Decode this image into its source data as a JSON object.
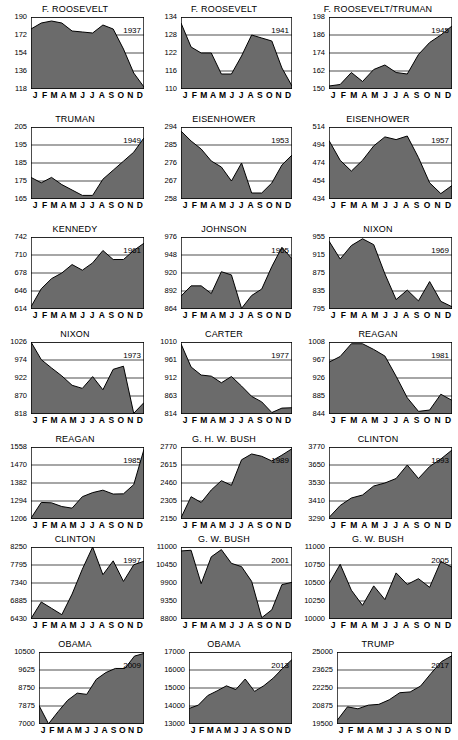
{
  "figure": {
    "type": "small-multiples-area-charts",
    "panel_count": 21,
    "x_tick_labels": [
      "J",
      "F",
      "M",
      "A",
      "M",
      "J",
      "J",
      "A",
      "S",
      "O",
      "N",
      "D"
    ],
    "area_fill_color": "#6b6b6b",
    "line_color": "#000000",
    "grid_color": "#000000",
    "background_color": "#ffffff"
  },
  "chart_data": [
    {
      "type": "area",
      "title": "F. ROOSEVELT",
      "annotation": "1937",
      "xlabel": "",
      "ylabel": "",
      "ylim": [
        118,
        190
      ],
      "yticks": [
        118,
        136,
        154,
        172,
        190
      ],
      "categories": [
        "J",
        "F",
        "M",
        "A",
        "M",
        "J",
        "J",
        "A",
        "S",
        "O",
        "N",
        "D"
      ],
      "values": [
        178,
        184,
        186,
        184,
        176,
        175,
        174,
        182,
        178,
        158,
        134,
        120
      ]
    },
    {
      "type": "area",
      "title": "F. ROOSEVELT",
      "annotation": "1941",
      "xlabel": "",
      "ylabel": "",
      "ylim": [
        110,
        134
      ],
      "yticks": [
        110,
        116,
        122,
        128,
        134
      ],
      "categories": [
        "J",
        "F",
        "M",
        "A",
        "M",
        "J",
        "J",
        "A",
        "S",
        "O",
        "N",
        "D"
      ],
      "values": [
        132,
        124,
        122,
        122,
        115,
        115,
        121,
        128,
        127,
        126,
        117,
        111
      ]
    },
    {
      "type": "area",
      "title": "F. ROOSEVELT/TRUMAN",
      "annotation": "1945",
      "xlabel": "",
      "ylabel": "",
      "ylim": [
        150,
        198
      ],
      "yticks": [
        150,
        162,
        174,
        186,
        198
      ],
      "categories": [
        "J",
        "F",
        "M",
        "A",
        "M",
        "J",
        "J",
        "A",
        "S",
        "O",
        "N",
        "D"
      ],
      "values": [
        152,
        153,
        161,
        155,
        163,
        166,
        161,
        160,
        173,
        181,
        186,
        192
      ]
    },
    {
      "type": "area",
      "title": "TRUMAN",
      "annotation": "1949",
      "xlabel": "",
      "ylabel": "",
      "ylim": [
        165,
        205
      ],
      "yticks": [
        165,
        175,
        185,
        195,
        205
      ],
      "categories": [
        "J",
        "F",
        "M",
        "A",
        "M",
        "J",
        "J",
        "A",
        "S",
        "O",
        "N",
        "D"
      ],
      "values": [
        177,
        174,
        177,
        173,
        170,
        167,
        167,
        176,
        181,
        186,
        191,
        199
      ]
    },
    {
      "type": "area",
      "title": "EISENHOWER",
      "annotation": "1953",
      "xlabel": "",
      "ylabel": "",
      "ylim": [
        258,
        294
      ],
      "yticks": [
        258,
        267,
        276,
        285,
        294
      ],
      "categories": [
        "J",
        "F",
        "M",
        "A",
        "M",
        "J",
        "J",
        "A",
        "S",
        "O",
        "N",
        "D"
      ],
      "values": [
        292,
        287,
        283,
        277,
        274,
        267,
        276,
        261,
        261,
        266,
        275,
        280
      ]
    },
    {
      "type": "area",
      "title": "EISENHOWER",
      "annotation": "1957",
      "xlabel": "",
      "ylabel": "",
      "ylim": [
        434,
        514
      ],
      "yticks": [
        434,
        454,
        474,
        494,
        514
      ],
      "categories": [
        "J",
        "F",
        "M",
        "A",
        "M",
        "J",
        "J",
        "A",
        "S",
        "O",
        "N",
        "D"
      ],
      "values": [
        499,
        477,
        465,
        477,
        493,
        503,
        500,
        504,
        480,
        452,
        440,
        449
      ]
    },
    {
      "type": "area",
      "title": "KENNEDY",
      "annotation": "1961",
      "xlabel": "",
      "ylabel": "",
      "ylim": [
        614,
        742
      ],
      "yticks": [
        614,
        646,
        678,
        710,
        742
      ],
      "categories": [
        "J",
        "F",
        "M",
        "A",
        "M",
        "J",
        "J",
        "A",
        "S",
        "O",
        "N",
        "D"
      ],
      "values": [
        618,
        650,
        668,
        678,
        693,
        683,
        696,
        718,
        702,
        702,
        718,
        731
      ]
    },
    {
      "type": "area",
      "title": "JOHNSON",
      "annotation": "1965",
      "xlabel": "",
      "ylabel": "",
      "ylim": [
        864,
        976
      ],
      "yticks": [
        864,
        892,
        920,
        948,
        976
      ],
      "categories": [
        "J",
        "F",
        "M",
        "A",
        "M",
        "J",
        "J",
        "A",
        "S",
        "O",
        "N",
        "D"
      ],
      "values": [
        884,
        900,
        900,
        888,
        922,
        917,
        865,
        885,
        895,
        930,
        960,
        942
      ]
    },
    {
      "type": "area",
      "title": "NIXON",
      "annotation": "1969",
      "xlabel": "",
      "ylabel": "",
      "ylim": [
        795,
        955
      ],
      "yticks": [
        795,
        835,
        875,
        915,
        955
      ],
      "categories": [
        "J",
        "F",
        "M",
        "A",
        "M",
        "J",
        "J",
        "A",
        "S",
        "O",
        "N",
        "D"
      ],
      "values": [
        946,
        906,
        936,
        951,
        938,
        873,
        816,
        837,
        813,
        856,
        812,
        800
      ]
    },
    {
      "type": "area",
      "title": "NIXON",
      "annotation": "1973",
      "xlabel": "",
      "ylabel": "",
      "ylim": [
        818,
        1026
      ],
      "yticks": [
        818,
        870,
        922,
        974,
        1026
      ],
      "categories": [
        "J",
        "F",
        "M",
        "A",
        "M",
        "J",
        "J",
        "A",
        "S",
        "O",
        "N",
        "D"
      ],
      "values": [
        1026,
        975,
        951,
        928,
        901,
        892,
        926,
        888,
        947,
        956,
        820,
        851
      ]
    },
    {
      "type": "area",
      "title": "CARTER",
      "annotation": "1977",
      "xlabel": "",
      "ylabel": "",
      "ylim": [
        814,
        1010
      ],
      "yticks": [
        814,
        863,
        912,
        961,
        1010
      ],
      "categories": [
        "J",
        "F",
        "M",
        "A",
        "M",
        "J",
        "J",
        "A",
        "S",
        "O",
        "N",
        "D"
      ],
      "values": [
        1005,
        942,
        920,
        917,
        899,
        916,
        890,
        862,
        847,
        818,
        830,
        831
      ]
    },
    {
      "type": "area",
      "title": "REAGAN",
      "annotation": "1981",
      "xlabel": "",
      "ylabel": "",
      "ylim": [
        844,
        1008
      ],
      "yticks": [
        844,
        885,
        926,
        967,
        1008
      ],
      "categories": [
        "J",
        "F",
        "M",
        "A",
        "M",
        "J",
        "J",
        "A",
        "S",
        "O",
        "N",
        "D"
      ],
      "values": [
        962,
        975,
        1004,
        1004,
        991,
        976,
        930,
        881,
        850,
        853,
        889,
        875
      ]
    },
    {
      "type": "area",
      "title": "REAGAN",
      "annotation": "1985",
      "xlabel": "",
      "ylabel": "",
      "ylim": [
        1206,
        1558
      ],
      "yticks": [
        1206,
        1294,
        1382,
        1470,
        1558
      ],
      "categories": [
        "J",
        "F",
        "M",
        "A",
        "M",
        "J",
        "J",
        "A",
        "S",
        "O",
        "N",
        "D"
      ],
      "values": [
        1210,
        1287,
        1285,
        1267,
        1259,
        1315,
        1335,
        1347,
        1328,
        1329,
        1374,
        1547
      ]
    },
    {
      "type": "area",
      "title": "G. H. W. BUSH",
      "annotation": "1989",
      "xlabel": "",
      "ylabel": "",
      "ylim": [
        2150,
        2770
      ],
      "yticks": [
        2150,
        2305,
        2460,
        2615,
        2770
      ],
      "categories": [
        "J",
        "F",
        "M",
        "A",
        "M",
        "J",
        "J",
        "A",
        "S",
        "O",
        "N",
        "D"
      ],
      "values": [
        2160,
        2342,
        2292,
        2400,
        2480,
        2440,
        2660,
        2710,
        2690,
        2650,
        2700,
        2755
      ]
    },
    {
      "type": "area",
      "title": "CLINTON",
      "annotation": "1993",
      "xlabel": "",
      "ylabel": "",
      "ylim": [
        3290,
        3770
      ],
      "yticks": [
        3290,
        3410,
        3530,
        3650,
        3770
      ],
      "categories": [
        "J",
        "F",
        "M",
        "A",
        "M",
        "J",
        "J",
        "A",
        "S",
        "O",
        "N",
        "D"
      ],
      "values": [
        3300,
        3380,
        3430,
        3450,
        3510,
        3530,
        3560,
        3650,
        3560,
        3640,
        3690,
        3750
      ]
    },
    {
      "type": "area",
      "title": "CLINTON",
      "annotation": "1997",
      "xlabel": "",
      "ylabel": "",
      "ylim": [
        6430,
        8250
      ],
      "yticks": [
        6430,
        6885,
        7340,
        7795,
        8250
      ],
      "categories": [
        "J",
        "F",
        "M",
        "A",
        "M",
        "J",
        "J",
        "A",
        "S",
        "O",
        "N",
        "D"
      ],
      "values": [
        6440,
        6860,
        6700,
        6540,
        7060,
        7690,
        8250,
        7550,
        7900,
        7380,
        7800,
        7890
      ]
    },
    {
      "type": "area",
      "title": "G. W. BUSH",
      "annotation": "2001",
      "xlabel": "",
      "ylabel": "",
      "ylim": [
        8800,
        11000
      ],
      "yticks": [
        8800,
        9350,
        9900,
        10450,
        11000
      ],
      "categories": [
        "J",
        "F",
        "M",
        "A",
        "M",
        "J",
        "J",
        "A",
        "S",
        "O",
        "N",
        "D"
      ],
      "values": [
        10880,
        10900,
        9880,
        10700,
        10920,
        10500,
        10400,
        9950,
        8840,
        9080,
        9850,
        9920
      ]
    },
    {
      "type": "area",
      "title": "G. W. BUSH",
      "annotation": "2005",
      "xlabel": "",
      "ylabel": "",
      "ylim": [
        10000,
        11000
      ],
      "yticks": [
        10000,
        10250,
        10500,
        10750,
        11000
      ],
      "categories": [
        "J",
        "F",
        "M",
        "A",
        "M",
        "J",
        "J",
        "A",
        "S",
        "O",
        "N",
        "D"
      ],
      "values": [
        10490,
        10760,
        10400,
        10190,
        10460,
        10270,
        10640,
        10480,
        10560,
        10440,
        10800,
        10720
      ]
    },
    {
      "type": "area",
      "title": "OBAMA",
      "annotation": "2009",
      "xlabel": "",
      "ylabel": "",
      "ylim": [
        7000,
        10500
      ],
      "yticks": [
        7000,
        7875,
        8750,
        9625,
        10500
      ],
      "categories": [
        "J",
        "F",
        "M",
        "A",
        "M",
        "J",
        "J",
        "A",
        "S",
        "O",
        "N",
        "D"
      ],
      "values": [
        7900,
        7010,
        7600,
        8150,
        8500,
        8440,
        9170,
        9500,
        9700,
        9700,
        10300,
        10430
      ]
    },
    {
      "type": "area",
      "title": "OBAMA",
      "annotation": "2013",
      "xlabel": "",
      "ylabel": "",
      "ylim": [
        13000,
        17000
      ],
      "yticks": [
        13000,
        14000,
        15000,
        16000,
        17000
      ],
      "categories": [
        "J",
        "F",
        "M",
        "A",
        "M",
        "J",
        "J",
        "A",
        "S",
        "O",
        "N",
        "D"
      ],
      "values": [
        13860,
        14050,
        14580,
        14840,
        15120,
        14910,
        15500,
        14810,
        15130,
        15550,
        16090,
        16580
      ]
    },
    {
      "type": "area",
      "title": "TRUMP",
      "annotation": "2017",
      "xlabel": "",
      "ylabel": "",
      "ylim": [
        19500,
        25000
      ],
      "yticks": [
        19500,
        20875,
        22250,
        23625,
        25000
      ],
      "categories": [
        "J",
        "F",
        "M",
        "A",
        "M",
        "J",
        "J",
        "A",
        "S",
        "O",
        "N",
        "D"
      ],
      "values": [
        19760,
        20810,
        20660,
        20940,
        21000,
        21350,
        21890,
        21950,
        22400,
        23370,
        24270,
        24720
      ]
    }
  ]
}
